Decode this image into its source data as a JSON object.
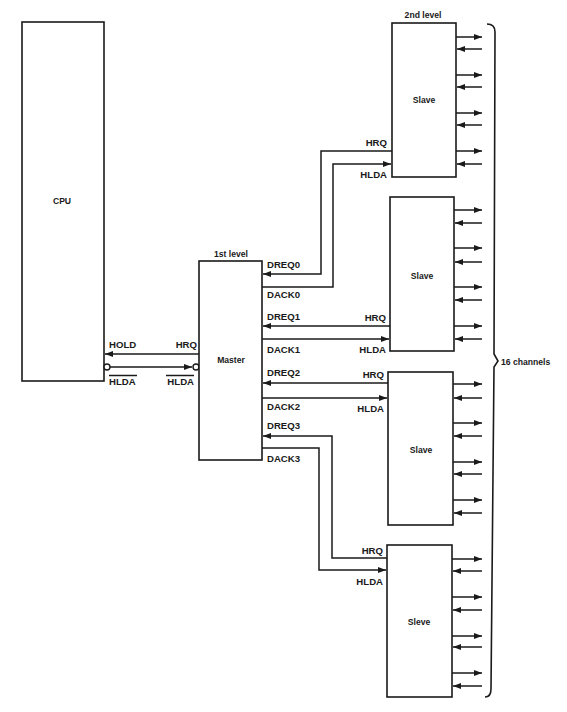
{
  "diagram": {
    "cpu": {
      "label": "CPU"
    },
    "cpu_signals": {
      "hold": "HOLD",
      "hlda": "HLDA"
    },
    "master": {
      "label": "Master",
      "level_label": "1st level",
      "hrq": "HRQ",
      "hlda": "HLDA"
    },
    "master_ports": {
      "dreq0": "DREQ0",
      "dack0": "DACK0",
      "dreq1": "DREQ1",
      "dack1": "DACK1",
      "dreq2": "DREQ2",
      "dack2": "DACK2",
      "dreq3": "DREQ3",
      "dack3": "DACK3"
    },
    "slave_level_label": "2nd level",
    "slaves": [
      {
        "label": "Slave",
        "hrq": "HRQ",
        "hlda": "HLDA"
      },
      {
        "label": "Slave",
        "hrq": "HRQ",
        "hlda": "HLDA"
      },
      {
        "label": "Slave",
        "hrq": "HRQ",
        "hlda": "HLDA"
      },
      {
        "label": "Sleve",
        "hrq": "HRQ",
        "hlda": "HLDA"
      }
    ],
    "channels_label": "16 channels",
    "colors": {
      "line": "#1a1a1a",
      "background": "#ffffff"
    }
  }
}
